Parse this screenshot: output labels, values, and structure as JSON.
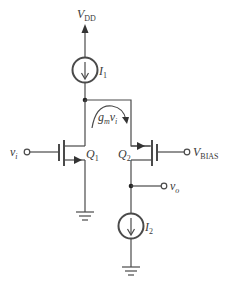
{
  "diagram": {
    "type": "circuit-schematic",
    "colors": {
      "wire": "#4a4a4a",
      "background": "#ffffff"
    },
    "supply": {
      "label": "V",
      "subscript": "DD"
    },
    "current_sources": [
      {
        "id": "I1",
        "label": "I",
        "subscript": "1"
      },
      {
        "id": "I2",
        "label": "I",
        "subscript": "2"
      }
    ],
    "transistors": [
      {
        "id": "Q1",
        "label": "Q",
        "subscript": "1"
      },
      {
        "id": "Q2",
        "label": "Q",
        "subscript": "2"
      }
    ],
    "annotation": {
      "label": "g",
      "subscript_m": "m",
      "var": "v",
      "var_subscript": "i"
    },
    "terminals": {
      "input": {
        "label": "v",
        "subscript": "i"
      },
      "bias": {
        "label": "V",
        "subscript": "BIAS"
      },
      "output": {
        "label": "v",
        "subscript": "o"
      }
    }
  }
}
